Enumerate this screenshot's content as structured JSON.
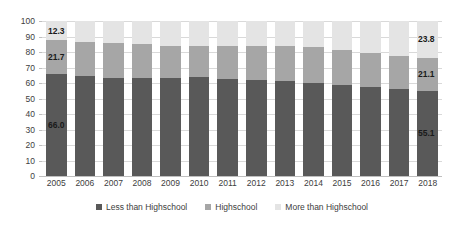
{
  "chart_data": {
    "type": "bar",
    "subtype": "stacked-100-percent",
    "title": "",
    "subtitle": "",
    "xlabel": "",
    "ylabel": "",
    "ylim": [
      0,
      100
    ],
    "ytick_step": 10,
    "grid": true,
    "legend_position": "bottom",
    "categories": [
      "2005",
      "2006",
      "2007",
      "2008",
      "2009",
      "2010",
      "2011",
      "2012",
      "2013",
      "2014",
      "2015",
      "2016",
      "2017",
      "2018"
    ],
    "series": [
      {
        "name": "Less than Highschool",
        "color": "#595959",
        "values": [
          66.0,
          64.6,
          63.3,
          63.4,
          63.2,
          63.6,
          62.4,
          61.8,
          61.0,
          60.3,
          59.0,
          57.6,
          56.3,
          55.1
        ]
      },
      {
        "name": "Highschool",
        "color": "#a6a6a6",
        "values": [
          21.7,
          22.0,
          22.8,
          22.0,
          21.0,
          20.6,
          21.6,
          22.4,
          22.8,
          23.0,
          22.0,
          21.9,
          21.4,
          21.1
        ]
      },
      {
        "name": "More than Highschool",
        "color": "#e4e4e4",
        "values": [
          12.3,
          13.4,
          13.9,
          14.6,
          15.8,
          15.8,
          16.0,
          15.8,
          16.2,
          16.7,
          19.0,
          20.5,
          22.3,
          23.8
        ]
      }
    ],
    "ytick_labels": [
      "0",
      "10",
      "20",
      "30",
      "40",
      "50",
      "60",
      "70",
      "80",
      "90",
      "100"
    ],
    "data_labels": [
      {
        "text": "12.3",
        "series": "More than Highschool",
        "category": "2005"
      },
      {
        "text": "21.7",
        "series": "Highschool",
        "category": "2005"
      },
      {
        "text": "66.0",
        "series": "Less than Highschool",
        "category": "2005"
      },
      {
        "text": "23.8",
        "series": "More than Highschool",
        "category": "2018"
      },
      {
        "text": "21.1",
        "series": "Highschool",
        "category": "2018"
      },
      {
        "text": "55.1",
        "series": "Less than Highschool",
        "category": "2018"
      }
    ]
  },
  "legend": {
    "items": [
      {
        "label": "Less than Highschool",
        "color": "#595959"
      },
      {
        "label": "Highschool",
        "color": "#a6a6a6"
      },
      {
        "label": "More than Highschool",
        "color": "#e4e4e4"
      }
    ]
  }
}
